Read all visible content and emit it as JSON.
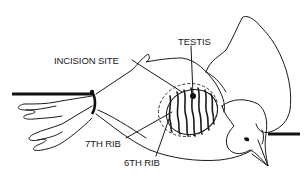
{
  "diagram": {
    "labels": {
      "testis": "TESTIS",
      "incision_site": "INCISION SITE",
      "seventh_rib": "7TH RIB",
      "sixth_rib": "6TH RIB"
    },
    "colors": {
      "line": "#1a1a1a",
      "background": "#ffffff"
    }
  }
}
